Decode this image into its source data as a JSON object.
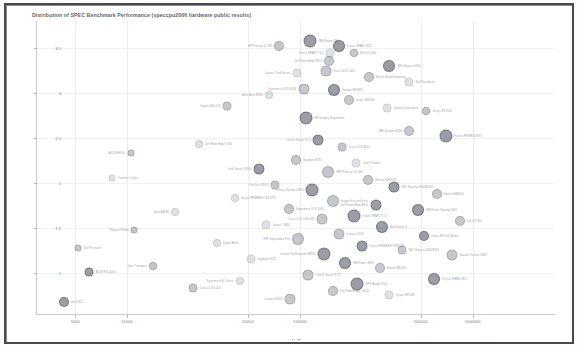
{
  "chart_data": {
    "type": "scatter",
    "title": "Distribution of SPEC Benchmark Performance (speccpu2006 hardware public results)",
    "xlabel": "AUD",
    "ylabel": "Performance (size ratio)",
    "xscale": "log",
    "xlim": [
      3000,
      3000000
    ],
    "ylim": [
      0.55,
      3.8
    ],
    "grid": true,
    "legend_position": "none",
    "xticks": [
      5000,
      10000,
      50000,
      100000,
      500000,
      1000000
    ],
    "xtick_labels": [
      "5000",
      "10000",
      "50000",
      "100000",
      "500000",
      "1000000"
    ],
    "yticks": [
      1,
      1.5,
      2,
      2.5,
      3,
      3.5
    ],
    "ytick_labels": [
      "1",
      "1.5",
      "2",
      "2.5",
      "3",
      "3.5"
    ],
    "marker_style": "bubble",
    "points": [
      {
        "x": 115000,
        "y": 3.58,
        "size": 13,
        "shade": "dark",
        "label": "IBM Power 780",
        "side": "right"
      },
      {
        "x": 76000,
        "y": 3.52,
        "size": 10,
        "shade": "mid",
        "label": "HP ProLiant DL580",
        "side": "left"
      },
      {
        "x": 168000,
        "y": 3.52,
        "size": 12,
        "shade": "dark",
        "label": "Fujitsu SPARC M10",
        "side": "right"
      },
      {
        "x": 150000,
        "y": 3.44,
        "size": 9,
        "shade": "light",
        "label": "Oracle SPARC T5-4",
        "side": "left"
      },
      {
        "x": 205000,
        "y": 3.44,
        "size": 8,
        "shade": "mid",
        "label": "SGI UV 2000",
        "side": "right"
      },
      {
        "x": 148000,
        "y": 3.36,
        "size": 10,
        "shade": "mid",
        "label": "Dell PowerEdge R920",
        "side": "left"
      },
      {
        "x": 330000,
        "y": 3.3,
        "size": 12,
        "shade": "dark",
        "label": "NEC Express5800",
        "side": "right"
      },
      {
        "x": 141000,
        "y": 3.25,
        "size": 11,
        "shade": "mid",
        "label": "Cisco UCS C460",
        "side": "right"
      },
      {
        "x": 96000,
        "y": 3.22,
        "size": 9,
        "shade": "light",
        "label": "Lenovo ThinkServer",
        "side": "left"
      },
      {
        "x": 250000,
        "y": 3.18,
        "size": 10,
        "shade": "mid",
        "label": "Hitachi BladeSymphony",
        "side": "right"
      },
      {
        "x": 430000,
        "y": 3.12,
        "size": 9,
        "shade": "light",
        "label": "Bull NovaScale",
        "side": "right"
      },
      {
        "x": 105000,
        "y": 3.05,
        "size": 11,
        "shade": "mid",
        "label": "Supermicro SYS-8028",
        "side": "left"
      },
      {
        "x": 158000,
        "y": 3.04,
        "size": 12,
        "shade": "dark",
        "label": "Huawei RH5885",
        "side": "right"
      },
      {
        "x": 66000,
        "y": 2.98,
        "size": 8,
        "shade": "light",
        "label": "Acer Altos R380",
        "side": "left"
      },
      {
        "x": 192000,
        "y": 2.92,
        "size": 10,
        "shade": "mid",
        "label": "Inspur NF8460",
        "side": "right"
      },
      {
        "x": 38000,
        "y": 2.86,
        "size": 9,
        "shade": "mid",
        "label": "Sugon I840-G25",
        "side": "left"
      },
      {
        "x": 320000,
        "y": 2.84,
        "size": 9,
        "shade": "light",
        "label": "Quanta QuantaGrid",
        "side": "right"
      },
      {
        "x": 540000,
        "y": 2.8,
        "size": 8,
        "shade": "mid",
        "label": "Unisys ES7000",
        "side": "right"
      },
      {
        "x": 108000,
        "y": 2.72,
        "size": 13,
        "shade": "dark",
        "label": "HP Integrity Superdome",
        "side": "right"
      },
      {
        "x": 430000,
        "y": 2.58,
        "size": 10,
        "shade": "mid",
        "label": "IBM System x3850",
        "side": "left"
      },
      {
        "x": 700000,
        "y": 2.52,
        "size": 13,
        "shade": "dark",
        "label": "Fujitsu PRIMEQUEST",
        "side": "right"
      },
      {
        "x": 128000,
        "y": 2.48,
        "size": 11,
        "shade": "dark",
        "label": "Oracle Server X5-8",
        "side": "left"
      },
      {
        "x": 26000,
        "y": 2.44,
        "size": 8,
        "shade": "light",
        "label": "Dell PowerEdge T630",
        "side": "right"
      },
      {
        "x": 176000,
        "y": 2.4,
        "size": 9,
        "shade": "mid",
        "label": "Cisco UCS B420",
        "side": "right"
      },
      {
        "x": 10500,
        "y": 2.34,
        "size": 7,
        "shade": "mid",
        "label": "ASUS RS700",
        "side": "left"
      },
      {
        "x": 95000,
        "y": 2.26,
        "size": 10,
        "shade": "mid",
        "label": "Gigabyte R281",
        "side": "right"
      },
      {
        "x": 212000,
        "y": 2.22,
        "size": 9,
        "shade": "light",
        "label": "Tyan Thunder",
        "side": "right"
      },
      {
        "x": 58000,
        "y": 2.16,
        "size": 11,
        "shade": "dark",
        "label": "Intel Server S2600",
        "side": "left"
      },
      {
        "x": 146000,
        "y": 2.12,
        "size": 12,
        "shade": "mid",
        "label": "HPE ProLiant DL380",
        "side": "right"
      },
      {
        "x": 8200,
        "y": 2.06,
        "size": 7,
        "shade": "light",
        "label": "Transtec Calleo",
        "side": "right"
      },
      {
        "x": 248000,
        "y": 2.04,
        "size": 10,
        "shade": "mid",
        "label": "Wistron WB6038",
        "side": "right"
      },
      {
        "x": 72000,
        "y": 1.98,
        "size": 9,
        "shade": "mid",
        "label": "Sun Fire X4470",
        "side": "left"
      },
      {
        "x": 350000,
        "y": 1.96,
        "size": 11,
        "shade": "dark",
        "label": "NEC Express5800/A2040",
        "side": "right"
      },
      {
        "x": 118000,
        "y": 1.92,
        "size": 13,
        "shade": "dark",
        "label": "Lenovo System x3950",
        "side": "left"
      },
      {
        "x": 620000,
        "y": 1.88,
        "size": 10,
        "shade": "mid",
        "label": "Hitachi HA8000",
        "side": "right"
      },
      {
        "x": 42000,
        "y": 1.84,
        "size": 8,
        "shade": "light",
        "label": "Fujitsu PRIMERGY RX4770",
        "side": "right"
      },
      {
        "x": 155000,
        "y": 1.8,
        "size": 12,
        "shade": "mid",
        "label": "Huawei FusionServer",
        "side": "right"
      },
      {
        "x": 275000,
        "y": 1.76,
        "size": 11,
        "shade": "dark",
        "label": "Dell PowerEdge R930",
        "side": "left"
      },
      {
        "x": 86000,
        "y": 1.72,
        "size": 10,
        "shade": "mid",
        "label": "Supermicro SYS-2049",
        "side": "right"
      },
      {
        "x": 480000,
        "y": 1.7,
        "size": 12,
        "shade": "dark",
        "label": "IBM Power System S824",
        "side": "right"
      },
      {
        "x": 19000,
        "y": 1.68,
        "size": 8,
        "shade": "light",
        "label": "Acer AR585",
        "side": "left"
      },
      {
        "x": 205000,
        "y": 1.64,
        "size": 13,
        "shade": "dark",
        "label": "Oracle SPARC T7-4",
        "side": "right"
      },
      {
        "x": 134000,
        "y": 1.6,
        "size": 11,
        "shade": "mid",
        "label": "Cisco UCS C480 M5",
        "side": "left"
      },
      {
        "x": 840000,
        "y": 1.58,
        "size": 10,
        "shade": "mid",
        "label": "SGI UV 300",
        "side": "right"
      },
      {
        "x": 64000,
        "y": 1.54,
        "size": 9,
        "shade": "light",
        "label": "Inspur TS860",
        "side": "right"
      },
      {
        "x": 300000,
        "y": 1.52,
        "size": 12,
        "shade": "dark",
        "label": "Bull bullion S",
        "side": "right"
      },
      {
        "x": 11000,
        "y": 1.48,
        "size": 7,
        "shade": "mid",
        "label": "Penguin Relion",
        "side": "left"
      },
      {
        "x": 168000,
        "y": 1.44,
        "size": 11,
        "shade": "mid",
        "label": "Quanta D51B",
        "side": "right"
      },
      {
        "x": 520000,
        "y": 1.42,
        "size": 10,
        "shade": "dark",
        "label": "Unisys ES7000 Model",
        "side": "right"
      },
      {
        "x": 98000,
        "y": 1.38,
        "size": 12,
        "shade": "mid",
        "label": "HPE Superdome Flex",
        "side": "left"
      },
      {
        "x": 33000,
        "y": 1.34,
        "size": 8,
        "shade": "light",
        "label": "Sugon A840r",
        "side": "right"
      },
      {
        "x": 228000,
        "y": 1.3,
        "size": 11,
        "shade": "dark",
        "label": "Fujitsu PRIMERGY RX2540",
        "side": "right"
      },
      {
        "x": 5200,
        "y": 1.28,
        "size": 7,
        "shade": "mid",
        "label": "Dell Precision",
        "side": "right"
      },
      {
        "x": 390000,
        "y": 1.26,
        "size": 9,
        "shade": "mid",
        "label": "NEC Express5800/R320",
        "side": "right"
      },
      {
        "x": 138000,
        "y": 1.22,
        "size": 13,
        "shade": "dark",
        "label": "Lenovo ThinkSystem SR950",
        "side": "left"
      },
      {
        "x": 760000,
        "y": 1.2,
        "size": 11,
        "shade": "mid",
        "label": "Huawei KunLun 9008",
        "side": "right"
      },
      {
        "x": 52000,
        "y": 1.16,
        "size": 9,
        "shade": "light",
        "label": "Gigabyte H261",
        "side": "right"
      },
      {
        "x": 182000,
        "y": 1.12,
        "size": 12,
        "shade": "dark",
        "label": "IBM Power E880",
        "side": "right"
      },
      {
        "x": 14000,
        "y": 1.08,
        "size": 8,
        "shade": "mid",
        "label": "Tyan Transport",
        "side": "left"
      },
      {
        "x": 290000,
        "y": 1.06,
        "size": 10,
        "shade": "mid",
        "label": "Hitachi BS2000",
        "side": "right"
      },
      {
        "x": 6000,
        "y": 1.02,
        "size": 9,
        "shade": "dark",
        "label": "ASUS ESC4000",
        "side": "right"
      },
      {
        "x": 112000,
        "y": 0.98,
        "size": 11,
        "shade": "mid",
        "label": "Oracle Server X7-8",
        "side": "right"
      },
      {
        "x": 600000,
        "y": 0.94,
        "size": 12,
        "shade": "dark",
        "label": "Fujitsu SPARC M12",
        "side": "right"
      },
      {
        "x": 45000,
        "y": 0.92,
        "size": 8,
        "shade": "light",
        "label": "Supermicro A+ Server",
        "side": "left"
      },
      {
        "x": 215000,
        "y": 0.88,
        "size": 13,
        "shade": "dark",
        "label": "HPE Apollo 6500",
        "side": "right"
      },
      {
        "x": 24000,
        "y": 0.84,
        "size": 9,
        "shade": "mid",
        "label": "Cisco UCS C240",
        "side": "right"
      },
      {
        "x": 155000,
        "y": 0.8,
        "size": 10,
        "shade": "mid",
        "label": "Dell PowerEdge C6420",
        "side": "right"
      },
      {
        "x": 4300,
        "y": 0.68,
        "size": 10,
        "shade": "dark",
        "label": "Intel NUC",
        "side": "right"
      },
      {
        "x": 330000,
        "y": 0.76,
        "size": 9,
        "shade": "light",
        "label": "Inspur NF5288",
        "side": "right"
      },
      {
        "x": 88000,
        "y": 0.72,
        "size": 11,
        "shade": "mid",
        "label": "Lenovo SD650",
        "side": "left"
      }
    ]
  }
}
